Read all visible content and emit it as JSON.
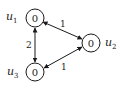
{
  "diagram": {
    "type": "graph",
    "directed": "bidirectional",
    "nodes": [
      {
        "id": "u1",
        "name": "u",
        "subscript": "1",
        "value": "0",
        "cx": 35,
        "cy": 18
      },
      {
        "id": "u2",
        "name": "u",
        "subscript": "2",
        "value": "0",
        "cx": 91,
        "cy": 43
      },
      {
        "id": "u3",
        "name": "u",
        "subscript": "3",
        "value": "0",
        "cx": 35,
        "cy": 72
      }
    ],
    "edges": [
      {
        "from": "u1",
        "to": "u2",
        "weight": "1"
      },
      {
        "from": "u1",
        "to": "u3",
        "weight": "2"
      },
      {
        "from": "u3",
        "to": "u2",
        "weight": "1"
      }
    ]
  }
}
